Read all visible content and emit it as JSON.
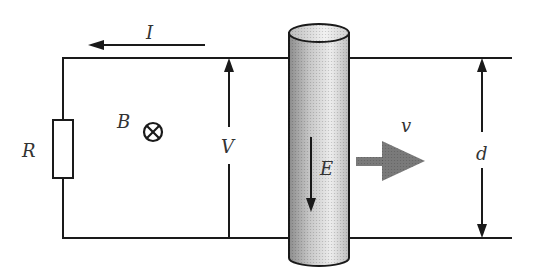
{
  "diagram": {
    "labels": {
      "current": "I",
      "field": "B",
      "resistor": "R",
      "voltage": "V",
      "electric_field": "E",
      "velocity": "v",
      "separation": "d"
    },
    "symbols": {
      "field_direction": "into-page (circle-cross)"
    },
    "colors": {
      "line": "#1a1a1a",
      "rod_shade": "#9a9a9a",
      "rod_light": "#e8e8e8",
      "velocity_arrow": "#7a7a7a"
    }
  }
}
